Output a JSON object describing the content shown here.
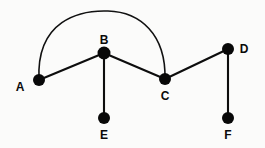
{
  "diagram": {
    "background_color": "#fbfbfa",
    "node_color": "#080808",
    "edge_color": "#0d0d0d",
    "label_color": "#0a0a0a",
    "node_radius": 6,
    "nodes": [
      {
        "id": "A",
        "label": "A",
        "cx": 39,
        "cy": 80,
        "lx": 20,
        "ly": 91,
        "anchor": "middle"
      },
      {
        "id": "B",
        "label": "B",
        "cx": 104,
        "cy": 53,
        "lx": 104,
        "ly": 44,
        "anchor": "middle"
      },
      {
        "id": "C",
        "label": "C",
        "cx": 165,
        "cy": 79,
        "lx": 165,
        "ly": 100,
        "anchor": "middle"
      },
      {
        "id": "D",
        "label": "D",
        "cx": 228,
        "cy": 49,
        "lx": 244,
        "ly": 53,
        "anchor": "middle"
      },
      {
        "id": "E",
        "label": "E",
        "cx": 104,
        "cy": 118,
        "lx": 104,
        "ly": 139,
        "anchor": "middle"
      },
      {
        "id": "F",
        "label": "F",
        "cx": 228,
        "cy": 118,
        "lx": 228,
        "ly": 139,
        "anchor": "middle"
      }
    ],
    "edges": [
      {
        "id": "A-B",
        "from": "A",
        "to": "B",
        "shape": "line",
        "x1": 39,
        "y1": 80,
        "x2": 104,
        "y2": 53
      },
      {
        "id": "B-C",
        "from": "B",
        "to": "C",
        "shape": "line",
        "x1": 104,
        "y1": 53,
        "x2": 165,
        "y2": 79
      },
      {
        "id": "C-D",
        "from": "C",
        "to": "D",
        "shape": "line",
        "x1": 165,
        "y1": 79,
        "x2": 228,
        "y2": 49
      },
      {
        "id": "B-E",
        "from": "B",
        "to": "E",
        "shape": "line",
        "x1": 104,
        "y1": 53,
        "x2": 104,
        "y2": 118
      },
      {
        "id": "D-F",
        "from": "D",
        "to": "F",
        "shape": "line",
        "x1": 228,
        "y1": 49,
        "x2": 228,
        "y2": 118
      },
      {
        "id": "A-C",
        "from": "A",
        "to": "C",
        "shape": "arc",
        "path": "M 39 80 C 36 20 80 10 108 11 C 140 12 166 34 165 79"
      }
    ]
  }
}
